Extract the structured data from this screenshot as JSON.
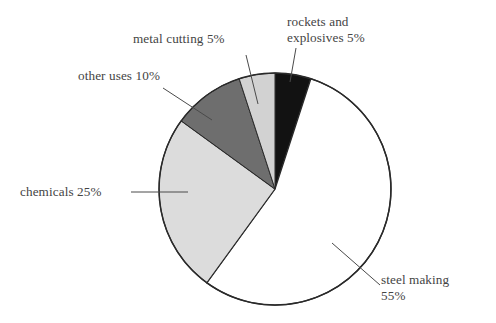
{
  "chart_data": {
    "type": "pie",
    "title": "",
    "subtitle": "",
    "xlabel": "",
    "ylabel": "",
    "legend": "none",
    "grid": false,
    "units": "percent",
    "total": 100,
    "start_angle_deg": 0,
    "direction": "clockwise",
    "categories": [
      "rockets and explosives",
      "steel making",
      "chemicals",
      "other uses",
      "metal cutting"
    ],
    "values": [
      5,
      55,
      25,
      10,
      5
    ],
    "slices": [
      {
        "name": "rockets and explosives",
        "value": 5,
        "label": "rockets and\nexplosives 5%",
        "color": "#121212",
        "start_deg": 0,
        "end_deg": 18
      },
      {
        "name": "steel making",
        "value": 55,
        "label": "steel making\n55%",
        "color": "#ffffff",
        "start_deg": 18,
        "end_deg": 216
      },
      {
        "name": "chemicals",
        "value": 25,
        "label": "chemicals 25%",
        "color": "#dcdcdc",
        "start_deg": 216,
        "end_deg": 306
      },
      {
        "name": "other uses",
        "value": 10,
        "label": "other uses 10%",
        "color": "#6e6e6e",
        "start_deg": 306,
        "end_deg": 342
      },
      {
        "name": "metal cutting",
        "value": 5,
        "label": "metal cutting 5%",
        "color": "#d2d2d2",
        "start_deg": 342,
        "end_deg": 360
      }
    ],
    "colors": {
      "outline": "#2a2a2a",
      "leader_line": "#4a4a4a",
      "background": "#ffffff",
      "text": "#444444"
    }
  },
  "labels": {
    "rockets": "rockets and\nexplosives 5%",
    "steel": "steel making\n55%",
    "chemicals": "chemicals 25%",
    "other": "other uses 10%",
    "metal": "metal cutting 5%"
  }
}
